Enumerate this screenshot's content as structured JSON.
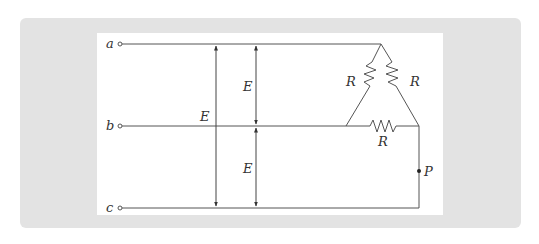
{
  "diagram": {
    "terminals": [
      {
        "label": "a",
        "y": 44
      },
      {
        "label": "b",
        "y": 126
      },
      {
        "label": "c",
        "y": 208
      }
    ],
    "voltages": {
      "line_to_line_label": "E",
      "phase_ab_label": "E",
      "phase_bc_label": "E"
    },
    "resistors": [
      {
        "label": "R",
        "position": "left-delta-branch"
      },
      {
        "label": "R",
        "position": "right-delta-branch"
      },
      {
        "label": "R",
        "position": "bottom-delta-branch"
      }
    ],
    "point": {
      "label": "P"
    },
    "colors": {
      "panel_bg": "#e3e3e3",
      "inner_bg": "#ffffff",
      "line": "#555555"
    }
  }
}
